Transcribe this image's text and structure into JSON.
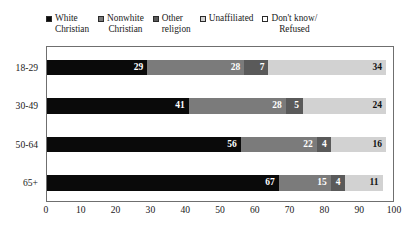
{
  "chart_data": {
    "type": "bar",
    "orientation": "horizontal",
    "stacked": true,
    "title": "",
    "xlabel": "",
    "ylabel": "",
    "xlim": [
      0,
      100
    ],
    "xticks": [
      "0",
      "10",
      "20",
      "30",
      "40",
      "50",
      "60",
      "70",
      "80",
      "90",
      "100"
    ],
    "grid": true,
    "legend_position": "top",
    "categories": [
      "18-29",
      "30-49",
      "50-64",
      "65+"
    ],
    "series": [
      {
        "name": "White Christian",
        "color": "#0a0a0a",
        "values": [
          29,
          41,
          56,
          67
        ]
      },
      {
        "name": "Nonwhite Christian",
        "color": "#7b7b7b",
        "values": [
          28,
          28,
          22,
          15
        ]
      },
      {
        "name": "Other religion",
        "color": "#5a5a5a",
        "values": [
          7,
          5,
          4,
          4
        ]
      },
      {
        "name": "Unaffiliated",
        "color": "#d2d2d2",
        "values": [
          34,
          24,
          16,
          11
        ]
      },
      {
        "name": "Don't know/ Refused",
        "color": "#ffffff",
        "values": [
          2,
          2,
          2,
          3
        ]
      }
    ],
    "legend": [
      {
        "line1": "White",
        "line2": "Christian",
        "swatch": "#0a0a0a"
      },
      {
        "line1": "Nonwhite",
        "line2": "Christian",
        "swatch": "#7b7b7b"
      },
      {
        "line1": "Other",
        "line2": "religion",
        "swatch": "#5a5a5a"
      },
      {
        "line1": "Unaffiliated",
        "line2": "",
        "swatch": "#d2d2d2"
      },
      {
        "line1": "Don't know/",
        "line2": "Refused",
        "swatch": "#ffffff"
      }
    ],
    "bar_labels": [
      [
        "29",
        "28",
        "7",
        "34",
        ""
      ],
      [
        "41",
        "28",
        "5",
        "24",
        ""
      ],
      [
        "56",
        "22",
        "4",
        "16",
        ""
      ],
      [
        "67",
        "15",
        "4",
        "11",
        ""
      ]
    ]
  }
}
